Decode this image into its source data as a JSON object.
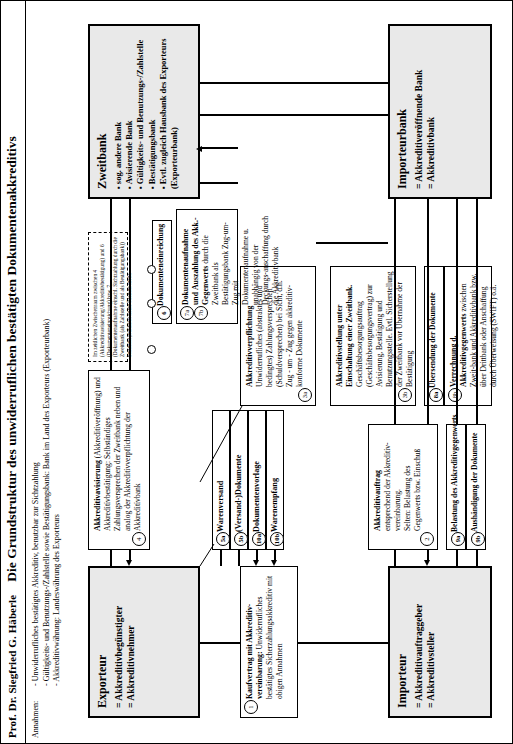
{
  "header": {
    "author": "Prof. Dr. Siegfried G. Häberle",
    "title": "Die Grundstruktur des unwiderruflichen bestätigten Dokumentenakkreditivs"
  },
  "assumptions": {
    "label": "Annahmen:",
    "items": [
      "- Unwiderrufliches bestätigtes Akkreditiv, benutzbar zur Sichtzahlung",
      "- Gültigkeits- und Benutzungs-/Zahlstelle sowie Bestätigungsbank: Bank im Land des Exporteurs (Exporteurbank)",
      "- Akkreditivwährung: Landeswährung des Exporteurs"
    ]
  },
  "actors": {
    "exporteur": {
      "name": "Exporteur",
      "roles": [
        "Akkreditivbegünstigter",
        "Akkreditivnehmer"
      ]
    },
    "importeur": {
      "name": "Importeur",
      "roles": [
        "Akkreditivauftraggeber",
        "Akkreditivsteller"
      ]
    },
    "zweitbank": {
      "name": "Zweitbank",
      "roles": [
        "sog. andere Bank",
        "Avisierende Bank",
        "Gültigkeits- und Benutzungs-/Zahlstelle",
        "Bestätigungsbank",
        "Evtl. zugleich Hausbank des Exporteurs (Exporteurbank)"
      ]
    },
    "importeurbank": {
      "name": "Importeurbank",
      "roles": [
        "Akkreditiveröffnende Bank",
        "Akkreditivbank"
      ]
    }
  },
  "steps": {
    "s1": {
      "num": "1",
      "title": "Kaufvertrag mit Akkreditiv-vereinbarung:",
      "text": "Unwiderrufliches bestätigtes Sicherzahlungsakkreditiv mit obigen Annahmen"
    },
    "s2": {
      "num": "2",
      "title": "Akkreditivauftrag",
      "text": "entsprechend der Akkreditiv-vereinbarung.\nSelten: Belastung des Gegenwerts bzw. Einschuß"
    },
    "s3a": {
      "num": "3a",
      "title": "Akkreditivverpflichtung",
      "text": "Unwiderrufliches (abstraktes und bedingtes) Zahlungsversprechen (Schuldversprechen) bei Sicht, d.h. Zug - um - Zug gegen akkreditiv-konforme Dokumente"
    },
    "s3b": {
      "num": "3b",
      "title": "Akkreditivstellung unter Einschaltung einer Zweitbank.",
      "text": "Geschäftsbesorgungsauftrag (Geschäftsbesorgungsvertrag) zur Avisierung, Bestätigung und Benutzungsstelle. Evtl. Sicherstellung der Zweitbank vor Übernahme der Bestätigung"
    },
    "s4": {
      "num": "4",
      "title": "Akkreditivavisierung",
      "text": "(Akkreditiveröffnung) und Akkreditivbestätigung: Selbständiges Zahlungsversprechen der Zweitbank neben und analog der Akkreditivverpflichtung der Akkreditivbank"
    },
    "s5a": {
      "num": "5a",
      "title": "Warenversand"
    },
    "s5b": {
      "num": "5b",
      "title": "(Versand-)Dokumente"
    },
    "s6": {
      "num": "6",
      "title": "Dokumenteneinreichung"
    },
    "s7a": {
      "num": "7a",
      "title": "Dokumentenaufnahme und"
    },
    "s7b": {
      "num": "7b",
      "title": "Auszahlung des Akk.-Gegenwerts",
      "text": "durch die Zweitbank als Bestätigungsbank Zug-um-Zug mit Dokumentenaufnahme u. unabhängig von der Deckungs-anschaffung durch die Akkreditivbank"
    },
    "s8a": {
      "num": "8a",
      "title": "Übersendung der Dokumente"
    },
    "s8b": {
      "num": "8b",
      "title": "Verrechnung d. Akkreditivgegenwerts",
      "text": "zwischen Zweit-bank und Akkreditivbank bzw. über Drittbank  oder  Anschaffung durch Überweisung (SWIFT) o.ä."
    },
    "s9a": {
      "num": "9a",
      "title": "Belastung des Akkreditivgegenwerts"
    },
    "s9b": {
      "num": "9b",
      "title": "Aushändigung der Dokumente"
    },
    "s10a": {
      "num": "10a",
      "title": "Dokumentenvorlage"
    },
    "s10b": {
      "num": "10b",
      "title": "Warenempfang"
    }
  },
  "callout": {
    "text": "Im zeitlichen Zwischenraum zwischen 4 (Akkreditivavisierung/Akkreditivbestätigung) und 6 (Dokumenteneinreichung) bzw. 7 (Dokumentenaufnahme einschl. Sichtzahlung durch die Zweitbank (als Zahlstelle und als Bestätigungsbank)) bestehen praktisch keine Risiken mehr.",
    "marker_4": "4",
    "marker_6": "6",
    "marker_7": "7"
  }
}
